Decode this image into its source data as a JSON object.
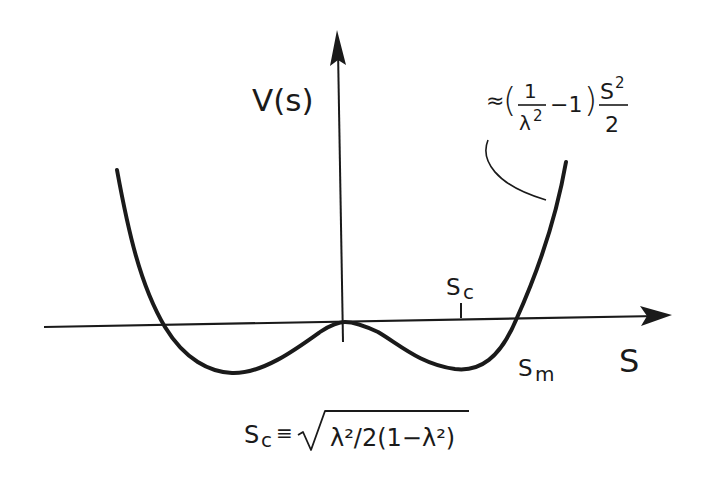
{
  "diagram": {
    "type": "potential-curve",
    "axes": {
      "y_label": "V(s)",
      "x_label": "S"
    },
    "curve": {
      "description": "Double-well potential with local maximum at origin and minima on either side",
      "asymptote_annotation": {
        "approx": "≈",
        "open_paren": "(",
        "frac_num": "1",
        "frac_den_base": "λ",
        "frac_den_exp": "2",
        "minus_one": "−1",
        "close_paren": ")",
        "s_base": "S",
        "s_exp": "2",
        "s_den": "2"
      }
    },
    "points": {
      "sc_label_base": "S",
      "sc_label_sub": "c",
      "sm_label_base": "S",
      "sm_label_sub": "m"
    },
    "definition": {
      "lhs_base": "S",
      "lhs_sub": "c",
      "equiv": "≡",
      "radicand": "λ²/2(1−λ²)"
    },
    "colors": {
      "ink": "#1a1a1a",
      "background": "#ffffff"
    }
  }
}
